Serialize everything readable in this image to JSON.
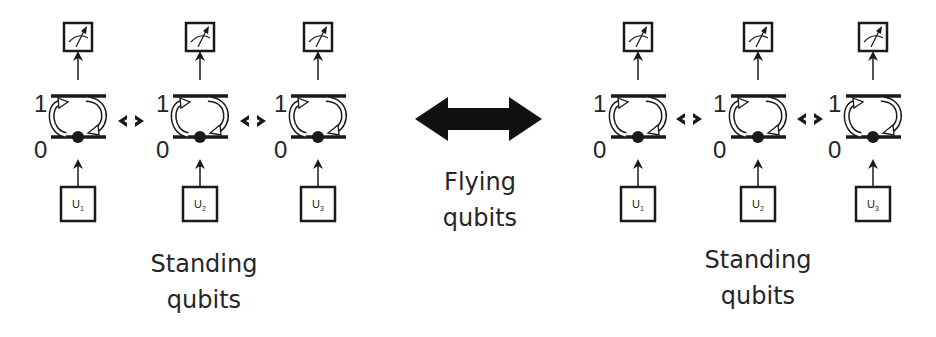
{
  "diagram": {
    "left_group": {
      "caption": {
        "line1": "Standing",
        "line2": "qubits"
      },
      "qubits": [
        {
          "level_top": "1",
          "level_bottom": "0",
          "control": "U",
          "control_index": "1",
          "measurement": "meter-icon"
        },
        {
          "level_top": "1",
          "level_bottom": "0",
          "control": "U",
          "control_index": "2",
          "measurement": "meter-icon"
        },
        {
          "level_top": "1",
          "level_bottom": "0",
          "control": "U",
          "control_index": "3",
          "measurement": "meter-icon"
        }
      ],
      "couplings": [
        "double-arrow",
        "double-arrow"
      ]
    },
    "center": {
      "arrow": "big-double-arrow",
      "caption": {
        "line1": "Flying",
        "line2": "qubits"
      }
    },
    "right_group": {
      "caption": {
        "line1": "Standing",
        "line2": "qubits"
      },
      "qubits": [
        {
          "level_top": "1",
          "level_bottom": "0",
          "control": "U",
          "control_index": "1",
          "measurement": "meter-icon"
        },
        {
          "level_top": "1",
          "level_bottom": "0",
          "control": "U",
          "control_index": "2",
          "measurement": "meter-icon"
        },
        {
          "level_top": "1",
          "level_bottom": "0",
          "control": "U",
          "control_index": "3",
          "measurement": "meter-icon"
        }
      ],
      "couplings": [
        "double-arrow",
        "double-arrow"
      ]
    },
    "colors": {
      "stroke": "#1a1a1a",
      "text": "#262626",
      "background": "#ffffff",
      "transition_arrow_fill": "#ffffff"
    }
  }
}
